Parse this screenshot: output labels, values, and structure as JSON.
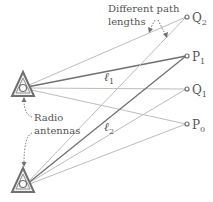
{
  "annotations": {
    "path_lengths_line1": "Different path",
    "path_lengths_line2": "lengths",
    "antennas_line1": "Radio",
    "antennas_line2": "antennas"
  },
  "points": [
    {
      "name": "Q",
      "sub": "2"
    },
    {
      "name": "P",
      "sub": "1"
    },
    {
      "name": "Q",
      "sub": "1"
    },
    {
      "name": "P",
      "sub": "0"
    }
  ],
  "paths": [
    {
      "name": "ℓ",
      "sub": "1"
    },
    {
      "name": "ℓ",
      "sub": "2"
    }
  ],
  "colors": {
    "light_line": "#b8b8b8",
    "dark_line": "#6e6e6e",
    "antenna": "#707070",
    "text": "#555555"
  }
}
